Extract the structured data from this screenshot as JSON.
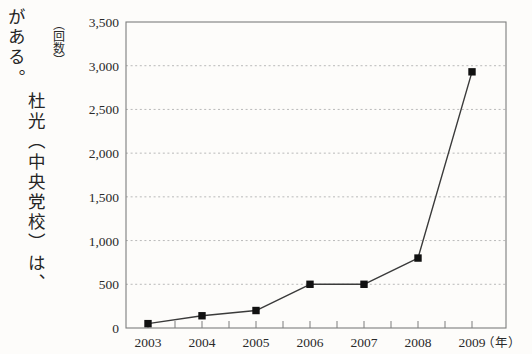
{
  "page": {
    "background_color": "#fdfcfa",
    "body_text_lines": [
      "がある。杜光（中央党校）は、",
      "杜光（中央党校）は、"
    ],
    "body_text_col1": "がある。",
    "body_text_col2": "杜光（中央党校）は、"
  },
  "chart_data": {
    "type": "line",
    "title": "",
    "xlabel": "（年）",
    "ylabel": "（回数）",
    "x": [
      2003,
      2004,
      2005,
      2006,
      2007,
      2008,
      2009
    ],
    "categories": [
      "2003",
      "2004",
      "2005",
      "2006",
      "2007",
      "2008",
      "2009"
    ],
    "values": [
      50,
      140,
      200,
      500,
      500,
      800,
      2930
    ],
    "series": [
      {
        "name": "回数",
        "values": [
          50,
          140,
          200,
          500,
          500,
          800,
          2930
        ]
      }
    ],
    "ylim": [
      0,
      3500
    ],
    "ytick_values": [
      0,
      500,
      1000,
      1500,
      2000,
      2500,
      3000,
      3500
    ],
    "ytick_labels": [
      "0",
      "500",
      "1,000",
      "1,500",
      "2,000",
      "2,500",
      "3,000",
      "3,500"
    ],
    "xtick_labels": [
      "2003",
      "2004",
      "2005",
      "2006",
      "2007",
      "2008",
      "2009"
    ],
    "grid": true,
    "grid_style": "dotted-horizontal",
    "legend": "none",
    "marker": "filled-square",
    "line_color": "#3a3a3a",
    "marker_color": "#111111",
    "grid_color": "#b9b9b9",
    "axis_color": "#7d7d7d"
  }
}
